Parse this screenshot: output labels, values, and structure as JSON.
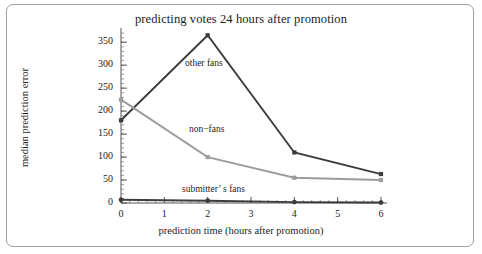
{
  "figure": {
    "title": "predicting votes 24 hours after promotion",
    "background": "#ffffff",
    "frame_color": "#9e9e9e"
  },
  "chart_data": {
    "type": "line",
    "title": "predicting votes 24 hours after promotion",
    "xlabel": "prediction time (hours after promotion)",
    "ylabel": "median prediction error",
    "x": [
      0,
      2,
      4,
      6
    ],
    "xlim": [
      0,
      6
    ],
    "ylim": [
      0,
      370
    ],
    "xticks": [
      0,
      1,
      2,
      3,
      4,
      5,
      6
    ],
    "xtick_labels": [
      "0",
      "1",
      "2",
      "3",
      "4",
      "5",
      "6"
    ],
    "yticks": [
      0,
      50,
      100,
      150,
      200,
      250,
      300,
      350
    ],
    "ytick_labels": [
      "0",
      "50",
      "100",
      "150",
      "200",
      "250",
      "300",
      "350"
    ],
    "x_minor_tick_step": 0.2,
    "y_minor_tick_step": 10,
    "grid": false,
    "legend": "inline-annotations",
    "series": [
      {
        "name": "other fans",
        "values": [
          180,
          365,
          110,
          63
        ],
        "color": "#3c3c3c",
        "marker": "square",
        "annotation": "other fans"
      },
      {
        "name": "non-fans",
        "values": [
          225,
          100,
          55,
          50
        ],
        "color": "#9c9c9c",
        "marker": "square",
        "annotation": "non−fans"
      },
      {
        "name": "submitter's fans",
        "values": [
          7,
          5,
          2,
          1
        ],
        "color": "#3c3c3c",
        "marker": "circle",
        "annotation": "submitter’ s fans"
      }
    ]
  },
  "annotations": {
    "other_fans": "other fans",
    "non_fans": "non−fans",
    "submitters_fans": "submitter’ s fans"
  },
  "axes": {
    "x_title": "prediction time (hours after promotion)",
    "y_title": "median prediction error"
  }
}
